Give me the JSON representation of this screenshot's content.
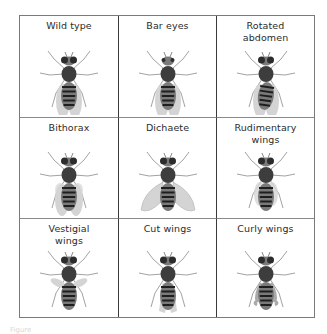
{
  "figure": {
    "caption_fragment": "Figure",
    "cells": [
      {
        "label": "Wild type",
        "wings": "normal",
        "eyes": "normal",
        "abdomen": "normal"
      },
      {
        "label": "Bar eyes",
        "wings": "normal",
        "eyes": "bar",
        "abdomen": "normal"
      },
      {
        "label": "Rotated abdomen",
        "wings": "normal",
        "eyes": "normal",
        "abdomen": "rotated"
      },
      {
        "label": "Bithorax",
        "wings": "bithorax",
        "eyes": "normal",
        "abdomen": "normal"
      },
      {
        "label": "Dichaete",
        "wings": "spread",
        "eyes": "normal",
        "abdomen": "normal"
      },
      {
        "label": "Rudimentary wings",
        "wings": "rudimentary",
        "eyes": "normal",
        "abdomen": "normal"
      },
      {
        "label": "Vestigial wings",
        "wings": "vestigial",
        "eyes": "normal",
        "abdomen": "normal"
      },
      {
        "label": "Cut wings",
        "wings": "cut",
        "eyes": "normal",
        "abdomen": "normal"
      },
      {
        "label": "Curly wings",
        "wings": "curly",
        "eyes": "normal",
        "abdomen": "normal"
      }
    ]
  },
  "colors": {
    "border": "#7a7a7a",
    "text": "#2b2b2b",
    "body_dark": "#3d3d3d",
    "body_mid": "#7a7a7a",
    "wing": "#d4d4d4"
  }
}
